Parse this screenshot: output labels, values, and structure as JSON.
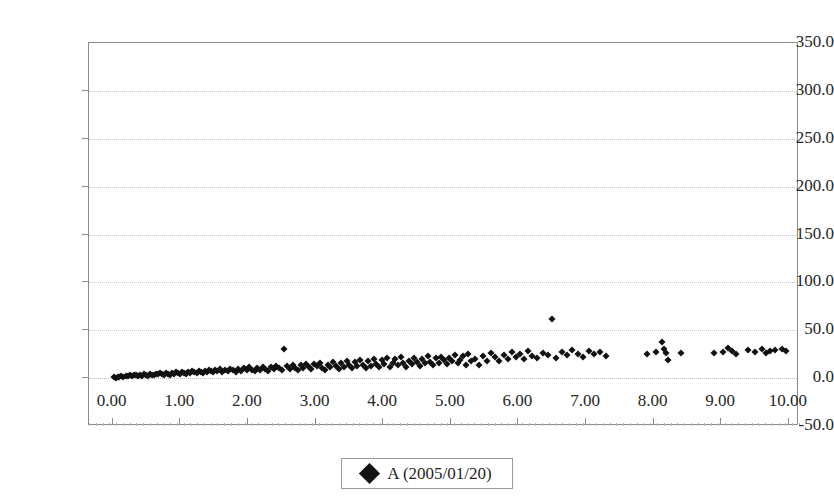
{
  "chart_data": {
    "type": "scatter",
    "title": "",
    "xlabel": "",
    "ylabel": "",
    "xlim": [
      -0.35,
      10.15
    ],
    "ylim": [
      -50.0,
      350.0
    ],
    "grid": true,
    "legend_position": "bottom-center",
    "y_ticks": [
      "350.0",
      "300.0",
      "250.0",
      "200.0",
      "150.0",
      "100.0",
      "50.0",
      "0.0",
      "-50.0"
    ],
    "y_tick_values": [
      350.0,
      300.0,
      250.0,
      200.0,
      150.0,
      100.0,
      50.0,
      0.0,
      -50.0
    ],
    "x_ticks": [
      "0.00",
      "1.00",
      "2.00",
      "3.00",
      "4.00",
      "5.00",
      "6.00",
      "7.00",
      "8.00",
      "9.00",
      "10.00"
    ],
    "x_tick_values": [
      0,
      1,
      2,
      3,
      4,
      5,
      6,
      7,
      8,
      9,
      10
    ],
    "series": [
      {
        "name": "A (2005/01/20)",
        "marker": "diamond",
        "color": "#111111",
        "points": [
          [
            0.02,
            1.0
          ],
          [
            0.05,
            0.5
          ],
          [
            0.08,
            1.5
          ],
          [
            0.1,
            0.8
          ],
          [
            0.13,
            2.0
          ],
          [
            0.16,
            1.2
          ],
          [
            0.19,
            2.5
          ],
          [
            0.22,
            1.8
          ],
          [
            0.25,
            3.0
          ],
          [
            0.28,
            2.2
          ],
          [
            0.31,
            3.5
          ],
          [
            0.34,
            2.8
          ],
          [
            0.37,
            1.9
          ],
          [
            0.4,
            3.2
          ],
          [
            0.43,
            2.4
          ],
          [
            0.46,
            4.0
          ],
          [
            0.49,
            3.1
          ],
          [
            0.52,
            2.6
          ],
          [
            0.55,
            4.2
          ],
          [
            0.58,
            3.4
          ],
          [
            0.61,
            2.9
          ],
          [
            0.64,
            4.5
          ],
          [
            0.67,
            3.8
          ],
          [
            0.7,
            5.0
          ],
          [
            0.73,
            4.1
          ],
          [
            0.76,
            3.3
          ],
          [
            0.79,
            5.2
          ],
          [
            0.82,
            4.6
          ],
          [
            0.85,
            3.7
          ],
          [
            0.88,
            5.5
          ],
          [
            0.91,
            4.8
          ],
          [
            0.94,
            6.0
          ],
          [
            0.97,
            5.1
          ],
          [
            1.0,
            4.3
          ],
          [
            1.03,
            6.2
          ],
          [
            1.06,
            5.4
          ],
          [
            1.09,
            4.7
          ],
          [
            1.12,
            6.5
          ],
          [
            1.15,
            5.8
          ],
          [
            1.18,
            7.0
          ],
          [
            1.21,
            6.1
          ],
          [
            1.24,
            5.3
          ],
          [
            1.27,
            7.2
          ],
          [
            1.3,
            6.4
          ],
          [
            1.33,
            5.6
          ],
          [
            1.36,
            7.5
          ],
          [
            1.39,
            6.8
          ],
          [
            1.42,
            8.0
          ],
          [
            1.45,
            7.1
          ],
          [
            1.48,
            6.3
          ],
          [
            1.51,
            8.2
          ],
          [
            1.55,
            7.4
          ],
          [
            1.58,
            9.5
          ],
          [
            1.62,
            6.7
          ],
          [
            1.66,
            8.5
          ],
          [
            1.7,
            7.8
          ],
          [
            1.74,
            10.0
          ],
          [
            1.78,
            8.1
          ],
          [
            1.82,
            6.9
          ],
          [
            1.86,
            9.2
          ],
          [
            1.9,
            7.6
          ],
          [
            1.94,
            10.5
          ],
          [
            1.98,
            8.4
          ],
          [
            2.02,
            11.5
          ],
          [
            2.06,
            9.0
          ],
          [
            2.1,
            7.3
          ],
          [
            2.14,
            10.8
          ],
          [
            2.18,
            8.8
          ],
          [
            2.22,
            12.0
          ],
          [
            2.26,
            9.6
          ],
          [
            2.3,
            7.9
          ],
          [
            2.34,
            11.2
          ],
          [
            2.38,
            9.3
          ],
          [
            2.42,
            13.0
          ],
          [
            2.46,
            10.2
          ],
          [
            2.5,
            8.3
          ],
          [
            2.54,
            30.0
          ],
          [
            2.58,
            12.5
          ],
          [
            2.62,
            9.9
          ],
          [
            2.66,
            14.0
          ],
          [
            2.7,
            11.0
          ],
          [
            2.74,
            8.6
          ],
          [
            2.78,
            13.5
          ],
          [
            2.82,
            10.4
          ],
          [
            2.86,
            15.0
          ],
          [
            2.9,
            11.8
          ],
          [
            2.94,
            9.1
          ],
          [
            2.98,
            14.5
          ],
          [
            3.02,
            12.2
          ],
          [
            3.06,
            16.0
          ],
          [
            3.1,
            10.6
          ],
          [
            3.14,
            8.9
          ],
          [
            3.18,
            13.2
          ],
          [
            3.22,
            11.4
          ],
          [
            3.26,
            17.0
          ],
          [
            3.3,
            12.8
          ],
          [
            3.34,
            9.8
          ],
          [
            3.38,
            15.5
          ],
          [
            3.42,
            11.6
          ],
          [
            3.46,
            18.0
          ],
          [
            3.5,
            13.8
          ],
          [
            3.54,
            10.1
          ],
          [
            3.58,
            16.5
          ],
          [
            3.62,
            12.4
          ],
          [
            3.66,
            19.0
          ],
          [
            3.7,
            14.2
          ],
          [
            3.74,
            10.9
          ],
          [
            3.78,
            17.5
          ],
          [
            3.82,
            13.1
          ],
          [
            3.86,
            20.0
          ],
          [
            3.9,
            15.2
          ],
          [
            3.94,
            11.7
          ],
          [
            3.98,
            18.5
          ],
          [
            4.02,
            14.8
          ],
          [
            4.06,
            21.0
          ],
          [
            4.1,
            12.1
          ],
          [
            4.14,
            16.2
          ],
          [
            4.18,
            19.5
          ],
          [
            4.22,
            13.6
          ],
          [
            4.26,
            22.0
          ],
          [
            4.3,
            15.8
          ],
          [
            4.34,
            11.3
          ],
          [
            4.38,
            18.2
          ],
          [
            4.42,
            14.4
          ],
          [
            4.46,
            20.5
          ],
          [
            4.5,
            16.8
          ],
          [
            4.54,
            12.7
          ],
          [
            4.58,
            19.8
          ],
          [
            4.62,
            15.4
          ],
          [
            4.66,
            23.0
          ],
          [
            4.7,
            17.2
          ],
          [
            4.74,
            13.4
          ],
          [
            4.78,
            20.8
          ],
          [
            4.82,
            16.0
          ],
          [
            4.86,
            22.5
          ],
          [
            4.9,
            18.8
          ],
          [
            4.94,
            14.6
          ],
          [
            4.98,
            21.5
          ],
          [
            5.02,
            17.8
          ],
          [
            5.06,
            24.0
          ],
          [
            5.1,
            15.6
          ],
          [
            5.14,
            19.2
          ],
          [
            5.18,
            22.8
          ],
          [
            5.22,
            13.9
          ],
          [
            5.26,
            25.0
          ],
          [
            5.3,
            18.4
          ],
          [
            5.36,
            20.2
          ],
          [
            5.42,
            14.1
          ],
          [
            5.48,
            23.5
          ],
          [
            5.54,
            17.5
          ],
          [
            5.6,
            26.0
          ],
          [
            5.66,
            21.8
          ],
          [
            5.72,
            18.0
          ],
          [
            5.78,
            24.5
          ],
          [
            5.84,
            20.0
          ],
          [
            5.9,
            27.0
          ],
          [
            5.96,
            22.2
          ],
          [
            6.02,
            25.5
          ],
          [
            6.08,
            19.5
          ],
          [
            6.14,
            28.0
          ],
          [
            6.2,
            23.2
          ],
          [
            6.28,
            21.0
          ],
          [
            6.36,
            26.5
          ],
          [
            6.44,
            24.2
          ],
          [
            6.5,
            62.0
          ],
          [
            6.56,
            20.5
          ],
          [
            6.64,
            27.5
          ],
          [
            6.72,
            23.8
          ],
          [
            6.8,
            29.0
          ],
          [
            6.88,
            25.2
          ],
          [
            6.96,
            22.5
          ],
          [
            7.04,
            28.5
          ],
          [
            7.12,
            24.8
          ],
          [
            7.2,
            26.8
          ],
          [
            7.3,
            23.0
          ],
          [
            7.9,
            25.5
          ],
          [
            8.04,
            27.0
          ],
          [
            8.12,
            38.0
          ],
          [
            8.16,
            30.5
          ],
          [
            8.18,
            26.0
          ],
          [
            8.22,
            18.5
          ],
          [
            8.4,
            25.8
          ],
          [
            8.9,
            26.5
          ],
          [
            9.02,
            27.5
          ],
          [
            9.1,
            31.0
          ],
          [
            9.16,
            28.0
          ],
          [
            9.22,
            25.0
          ],
          [
            9.4,
            29.5
          ],
          [
            9.5,
            27.8
          ],
          [
            9.6,
            30.0
          ],
          [
            9.66,
            26.2
          ],
          [
            9.72,
            28.8
          ],
          [
            9.8,
            29.2
          ],
          [
            9.9,
            30.5
          ],
          [
            9.96,
            28.2
          ]
        ]
      }
    ]
  },
  "legend": {
    "entries": [
      {
        "label": "A (2005/01/20)",
        "marker": "diamond-marker"
      }
    ]
  }
}
